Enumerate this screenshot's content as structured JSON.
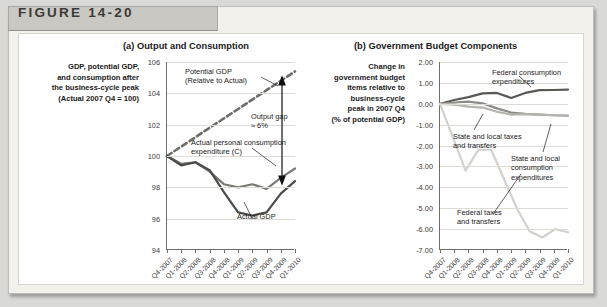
{
  "figure": {
    "header_label": "FIGURE 14-20"
  },
  "panel_a": {
    "title": "(a) Output and Consumption",
    "axis_caption": "GDP, potential GDP,\nand consumption after\nthe business-cycle peak\n(Actual 2007 Q4 = 100)",
    "annotations": {
      "potential_gdp": "Potential GDP\n(Relative to Actual)",
      "output_gap": "Output gap\n≈ 6%",
      "consumption": "Actual personal consumption\nexpenditure (C)",
      "actual_gdp": "Actual GDP"
    }
  },
  "panel_b": {
    "title": "(b) Government Budget Components",
    "axis_caption": "Change in\ngovernment budget\nitems relative to\nbusiness-cycle\npeak in 2007 Q4\n(% of potential GDP)",
    "annotations": {
      "federal_consumption": "Federal consumption\nexpenditures",
      "state_local_taxes": "State and local taxes\nand transfers",
      "state_local_consumption": "State and local\nconsumption\nexpenditures",
      "federal_taxes": "Federal taxes\nand transfers"
    }
  },
  "chart_data": [
    {
      "type": "line",
      "panel": "a",
      "title": "(a) Output and Consumption",
      "xlabel": "",
      "ylabel": "GDP, potential GDP, and consumption after the business-cycle peak (Actual 2007 Q4 = 100)",
      "x": [
        "Q4-2007",
        "Q1-2008",
        "Q2-2008",
        "Q3-2008",
        "Q4-2008",
        "Q1-2009",
        "Q2-2009",
        "Q3-2009",
        "Q4-2009",
        "Q1-2010"
      ],
      "ylim": [
        94,
        106
      ],
      "yticks": [
        94,
        96,
        98,
        100,
        102,
        104,
        106
      ],
      "grid": true,
      "legend": "inline-annotations",
      "series": [
        {
          "name": "Potential GDP (Relative to Actual)",
          "style": "dashed",
          "color": "#6e6d69",
          "values": [
            100.0,
            100.6,
            101.2,
            101.8,
            102.4,
            103.0,
            103.6,
            104.2,
            104.8,
            105.4
          ]
        },
        {
          "name": "Actual personal consumption expenditure (C)",
          "style": "solid",
          "color": "#7b7a76",
          "values": [
            100.0,
            99.5,
            99.6,
            99.0,
            98.2,
            98.0,
            98.2,
            97.9,
            98.6,
            99.2
          ]
        },
        {
          "name": "Actual GDP",
          "style": "solid",
          "color": "#4a4a48",
          "values": [
            100.0,
            99.4,
            99.6,
            99.1,
            97.7,
            96.4,
            96.2,
            96.4,
            97.6,
            98.4
          ]
        }
      ],
      "annotations": [
        {
          "text": "Output gap ≈ 6%",
          "type": "double-arrow",
          "x": "Q1-2010",
          "from": 99.3,
          "to": 105.3
        }
      ]
    },
    {
      "type": "line",
      "panel": "b",
      "title": "(b) Government Budget Components",
      "xlabel": "",
      "ylabel": "Change in government budget items relative to business-cycle peak in 2007 Q4 (% of potential GDP)",
      "x": [
        "Q4-2007",
        "Q1-2008",
        "Q2-2008",
        "Q3-2008",
        "Q4-2008",
        "Q1-2009",
        "Q2-2009",
        "Q3-2009",
        "Q4-2009",
        "Q1-2010"
      ],
      "ylim": [
        -7.0,
        2.0
      ],
      "yticks": [
        2.0,
        1.0,
        0.0,
        -1.0,
        -2.0,
        -3.0,
        -4.0,
        -5.0,
        -6.0,
        -7.0
      ],
      "ytick_labels": [
        "2.00",
        "1.00",
        "0.00",
        "-1.00",
        "-2.00",
        "-3.00",
        "-4.00",
        "-5.00",
        "-6.00",
        "-7.00"
      ],
      "grid": true,
      "legend": "inline-annotations",
      "series": [
        {
          "name": "Federal consumption expenditures",
          "style": "solid",
          "color": "#595854",
          "values": [
            0.0,
            0.18,
            0.32,
            0.5,
            0.52,
            0.28,
            0.52,
            0.65,
            0.66,
            0.68
          ]
        },
        {
          "name": "State and local consumption expenditures",
          "style": "solid",
          "color": "#8d8c88",
          "values": [
            0.0,
            0.06,
            0.1,
            0.02,
            -0.22,
            -0.42,
            -0.48,
            -0.52,
            -0.55,
            -0.56
          ]
        },
        {
          "name": "State and local taxes and transfers",
          "style": "solid",
          "color": "#b5b4b0",
          "values": [
            0.0,
            -0.04,
            -0.14,
            -0.18,
            -0.38,
            -0.52,
            -0.5,
            -0.52,
            -0.55,
            -0.58
          ]
        },
        {
          "name": "Federal taxes and transfers",
          "style": "solid",
          "color": "#d2d1cd",
          "values": [
            0.0,
            -1.6,
            -3.2,
            -2.2,
            -2.2,
            -3.6,
            -5.0,
            -6.1,
            -6.4,
            -6.0,
            -6.15
          ]
        }
      ]
    }
  ]
}
